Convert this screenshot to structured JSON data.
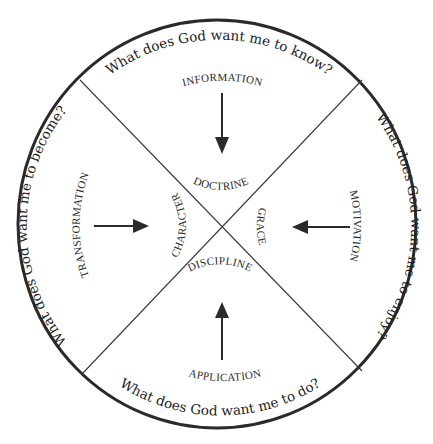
{
  "diagram": {
    "colors": {
      "stroke": "#2a2a2a",
      "text": "#222222",
      "background": "#ffffff"
    },
    "quadrants": {
      "top": {
        "question": "What does God want me to know?",
        "outer_label": "INFORMATION",
        "inner_label": "DOCTRINE",
        "arrow_direction": "down"
      },
      "right": {
        "question": "What does God want me to enjoy?",
        "outer_label": "MOTIVATION",
        "inner_label": "GRACE",
        "arrow_direction": "left"
      },
      "bottom": {
        "question": "What does God want me to do?",
        "outer_label": "APPLICATION",
        "inner_label": "DISCIPLINE",
        "arrow_direction": "up"
      },
      "left": {
        "question": "What does God want me to become?",
        "outer_label": "TRANSFORMATION",
        "inner_label": "CHARACTER",
        "arrow_direction": "right"
      }
    }
  }
}
